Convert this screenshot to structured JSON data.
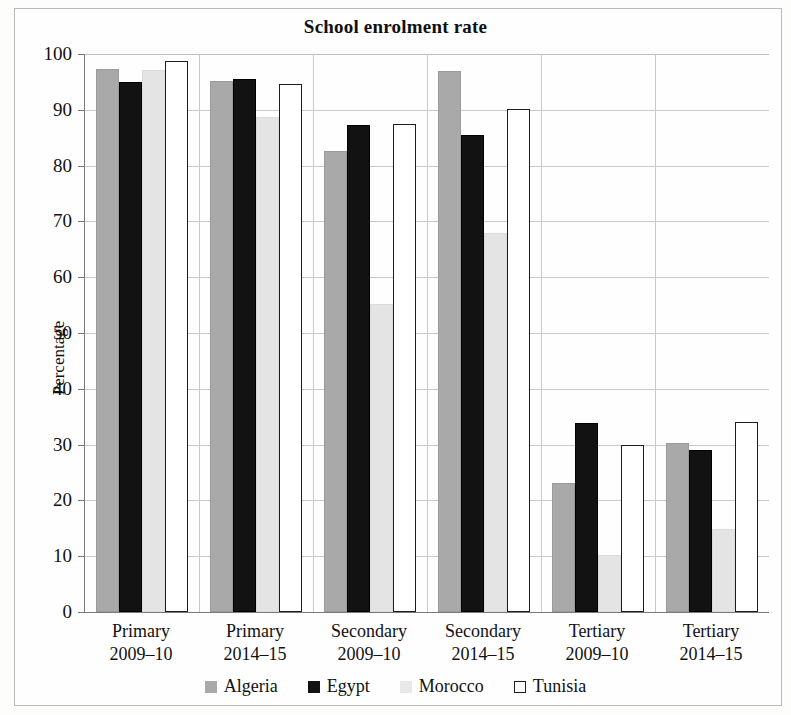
{
  "chart_data": {
    "type": "bar",
    "title": "School enrolment rate",
    "xlabel": "",
    "ylabel": "Percentage",
    "ylim": [
      0,
      100
    ],
    "ytick_step": 10,
    "yticks": [
      0,
      10,
      20,
      30,
      40,
      50,
      60,
      70,
      80,
      90,
      100
    ],
    "grid": true,
    "legend_position": "bottom",
    "categories": [
      "Primary\n2009–10",
      "Primary\n2014–15",
      "Secondary\n2009–10",
      "Secondary\n2014–15",
      "Tertiary\n2009–10",
      "Tertiary\n2014–15"
    ],
    "category_lines": [
      [
        "Primary",
        "2009–10"
      ],
      [
        "Primary",
        "2014–15"
      ],
      [
        "Secondary",
        "2009–10"
      ],
      [
        "Secondary",
        "2014–15"
      ],
      [
        "Tertiary",
        "2009–10"
      ],
      [
        "Tertiary",
        "2014–15"
      ]
    ],
    "series": [
      {
        "name": "Algeria",
        "color": "#a9a9a9",
        "values": [
          97.3,
          95.2,
          82.7,
          97.0,
          23.1,
          30.3
        ]
      },
      {
        "name": "Egypt",
        "color": "#121212",
        "values": [
          95.0,
          95.5,
          87.3,
          85.5,
          33.8,
          29.0
        ]
      },
      {
        "name": "Morocco",
        "color": "#e4e4e4",
        "values": [
          97.2,
          88.7,
          55.2,
          68.0,
          10.2,
          14.8
        ]
      },
      {
        "name": "Tunisia",
        "color": "#ffffff",
        "values": [
          98.8,
          94.7,
          87.5,
          90.2,
          29.9,
          34.0
        ]
      }
    ]
  },
  "legend": {
    "entries": [
      {
        "label": "Algeria",
        "key": "algeria"
      },
      {
        "label": "Egypt",
        "key": "egypt"
      },
      {
        "label": "Morocco",
        "key": "morocco"
      },
      {
        "label": "Tunisia",
        "key": "tunisia"
      }
    ]
  }
}
